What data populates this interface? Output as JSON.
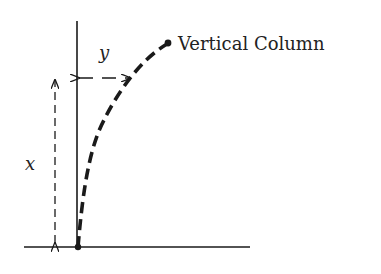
{
  "diagram": {
    "title_label": "Vertical Column",
    "dimension_labels": {
      "horizontal_deflection": "y",
      "height": "x"
    },
    "colors": {
      "ink": "#1a1a1a",
      "background": "#ffffff"
    },
    "elements": {
      "ground": "ground-line",
      "column": "vertical-column-line",
      "deflected_shape": "dashed-deflection-curve",
      "base_point": "base-dot",
      "tip_point": "tip-dot",
      "height_arrow": "double-headed-dashed-arrow",
      "deflection_arrow": "double-headed-dashed-arrow"
    }
  }
}
